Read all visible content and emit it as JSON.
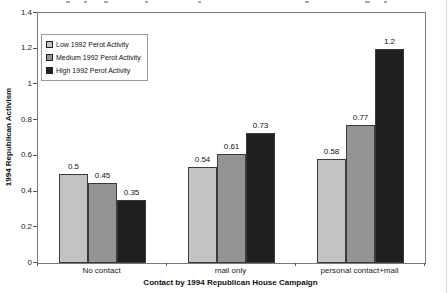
{
  "chart_data": {
    "type": "bar",
    "title": "",
    "xlabel": "Contact by 1994 Republican House Campaign",
    "ylabel": "1994 Republican Activism",
    "categories": [
      "No contact",
      "mail only",
      "personal contact+mail"
    ],
    "series": [
      {
        "name": "Low 1992 Perot Activity",
        "color": "#c3c3c3",
        "values": [
          0.5,
          0.54,
          0.58
        ]
      },
      {
        "name": "Medium 1992 Perot Activity",
        "color": "#949494",
        "values": [
          0.45,
          0.61,
          0.77
        ]
      },
      {
        "name": "High 1992 Perot Activity",
        "color": "#1f1f1f",
        "values": [
          0.35,
          0.73,
          1.2
        ]
      }
    ],
    "ylim": [
      0,
      1.4
    ],
    "ytick_labels": [
      "0",
      "0.2",
      "0.4",
      "0.6",
      "0.8",
      "1",
      "1.2",
      "1.4"
    ],
    "grid": false,
    "data_labels": true,
    "legend_position": "top-left-inside",
    "plot_border_color": "#7a7a7a",
    "background_color": "#ffffff"
  }
}
